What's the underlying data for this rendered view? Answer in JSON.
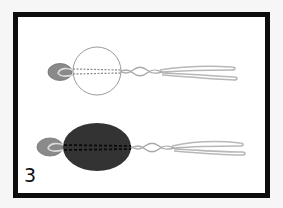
{
  "figure": {
    "step_number": "3",
    "colors": {
      "frame": "#0d0d0d",
      "background": "#ffffff",
      "small_bead": "#8a8a8a",
      "large_bead_filled": "#333333",
      "large_bead_outline": "#9a9a9a",
      "wire": "#b8b8b8"
    },
    "panels": [
      {
        "id": "top",
        "large_bead_state": "outline (transparent)"
      },
      {
        "id": "bottom",
        "large_bead_state": "filled dark"
      }
    ]
  }
}
